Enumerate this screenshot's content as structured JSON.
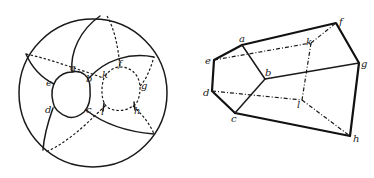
{
  "figure_left": {
    "description": "Sphere with two holes and a network of curves (solid = front, dotted = back)",
    "labels": {
      "a": "a",
      "b": "b",
      "c": "c",
      "d": "d",
      "e": "e",
      "f": "f",
      "g": "g",
      "h": "h",
      "k": "k",
      "l": "l"
    }
  },
  "figure_right": {
    "description": "Polyhedral net/solid with vertices a–h, k, l; dotted edges hidden",
    "labels": {
      "a": "a",
      "b": "b",
      "c": "c",
      "d": "d",
      "e": "e",
      "f": "f",
      "g": "g",
      "h": "h",
      "k": "k",
      "l": "l"
    }
  },
  "colors": {
    "ink": "#1a1a1a",
    "background": "#ffffff"
  }
}
